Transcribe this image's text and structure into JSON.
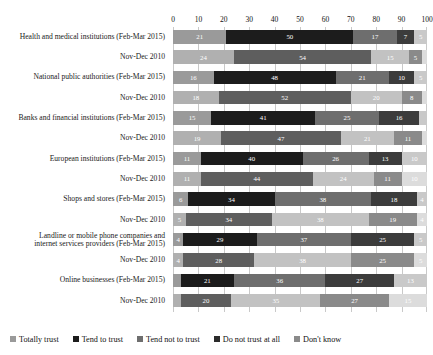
{
  "chart_data": {
    "type": "bar",
    "orientation": "horizontal",
    "stacked": true,
    "normalized_percent": true,
    "title": "",
    "subtitle": "",
    "xlabel": "",
    "ylabel": "",
    "xlim": [
      0,
      100
    ],
    "xticks": [
      0,
      10,
      20,
      30,
      40,
      50,
      60,
      70,
      80,
      90,
      100
    ],
    "grid": true,
    "grid_axis": "x",
    "legend_position": "bottom",
    "categories": [
      "Health and medical institutions (Feb-Mar 2015)",
      "Nov-Dec 2010",
      "National public authorities (Feb-Mar 2015)",
      "Nov-Dec 2010",
      "Banks and financial institutions (Feb-Mar 2015)",
      "Nov-Dec 2010",
      "European institutions (Feb-Mar 2015)",
      "Nov-Dec 2010",
      "Shops and stores (Feb-Mar 2015)",
      "Nov-Dec 2010",
      "Landline or mobile phone companies and internet services providers (Feb-Mar 2015)",
      "Nov-Dec 2010",
      "Online businesses (Feb-Mar 2015)",
      "Nov-Dec 2010"
    ],
    "series": [
      {
        "name": "Totally trust",
        "values": [
          21,
          24,
          16,
          18,
          15,
          19,
          11,
          11,
          6,
          5,
          4,
          4,
          3,
          3
        ]
      },
      {
        "name": "Tend to trust",
        "values": [
          50,
          54,
          48,
          52,
          41,
          47,
          40,
          44,
          34,
          34,
          29,
          28,
          21,
          20
        ]
      },
      {
        "name": "Tend not to trust",
        "values": [
          17,
          15,
          21,
          20,
          25,
          21,
          26,
          24,
          38,
          38,
          37,
          38,
          36,
          35
        ]
      },
      {
        "name": "Do not trust at all",
        "values": [
          7,
          5,
          10,
          8,
          16,
          11,
          13,
          11,
          18,
          19,
          25,
          25,
          27,
          27
        ]
      },
      {
        "name": "Don't know",
        "values": [
          5,
          2,
          5,
          2,
          3,
          2,
          10,
          10,
          4,
          4,
          5,
          5,
          13,
          15
        ]
      }
    ],
    "legend_entries": [
      "Totally trust",
      "Tend to trust",
      "Tend not to trust",
      "Do not trust at all",
      "Don't know"
    ],
    "colors_2015": [
      "#9a9a9a",
      "#1c1c1c",
      "#6e6e6e",
      "#3c3c3c",
      "#c9c9c9"
    ],
    "colors_2010": [
      "#b0b0b0",
      "#5e5e5e",
      "#c2c2c2",
      "#8a8a8a",
      "#dcdcdc"
    ],
    "legend_colors": [
      "#9a9a9a",
      "#1c1c1c",
      "#6e6e6e",
      "#2b2b2b",
      "#8a8a8a"
    ],
    "row_styles": [
      "a",
      "b",
      "a",
      "b",
      "a",
      "b",
      "a",
      "b",
      "a",
      "b",
      "a",
      "b",
      "a",
      "b"
    ],
    "label_lines": [
      [
        "Health and medical institutions (Feb-Mar 2015)"
      ],
      [
        "Nov-Dec 2010"
      ],
      [
        "National public authorities (Feb-Mar 2015)"
      ],
      [
        "Nov-Dec 2010"
      ],
      [
        "Banks and financial institutions (Feb-Mar 2015)"
      ],
      [
        "Nov-Dec 2010"
      ],
      [
        "European institutions (Feb-Mar 2015)"
      ],
      [
        "Nov-Dec 2010"
      ],
      [
        "Shops and stores (Feb-Mar 2015)"
      ],
      [
        "Nov-Dec 2010"
      ],
      [
        "Landline or mobile phone companies and",
        "internet services providers (Feb-Mar 2015)"
      ],
      [
        "Nov-Dec 2010"
      ],
      [
        "Online businesses (Feb-Mar 2015)"
      ],
      [
        "Nov-Dec 2010"
      ]
    ],
    "hidden_value_threshold": 4
  }
}
